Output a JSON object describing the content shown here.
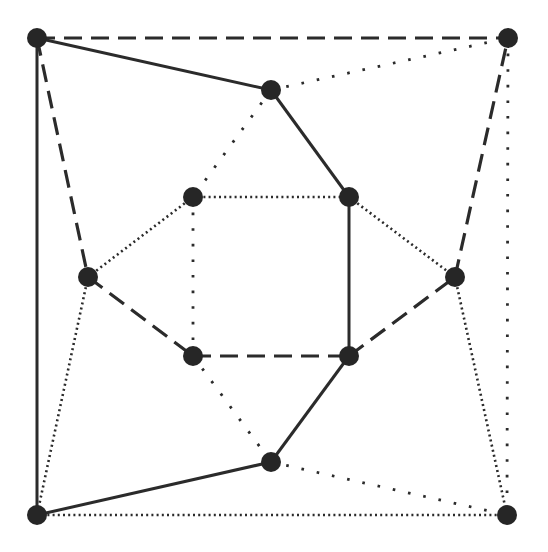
{
  "diagram": {
    "type": "graph",
    "colors": {
      "node": "#262626",
      "edge": "#2b2b2b",
      "background": "#ffffff"
    },
    "node_radius": 10,
    "nodes": [
      {
        "id": "A",
        "x": 37,
        "y": 38
      },
      {
        "id": "B",
        "x": 508,
        "y": 38
      },
      {
        "id": "C",
        "x": 271,
        "y": 90
      },
      {
        "id": "D",
        "x": 193,
        "y": 197
      },
      {
        "id": "E",
        "x": 349,
        "y": 197
      },
      {
        "id": "F",
        "x": 88,
        "y": 277
      },
      {
        "id": "G",
        "x": 455,
        "y": 277
      },
      {
        "id": "H",
        "x": 193,
        "y": 356
      },
      {
        "id": "I",
        "x": 349,
        "y": 356
      },
      {
        "id": "J",
        "x": 271,
        "y": 462
      },
      {
        "id": "K",
        "x": 37,
        "y": 515
      },
      {
        "id": "L",
        "x": 507,
        "y": 515
      }
    ],
    "edges": [
      {
        "from": "A",
        "to": "C",
        "style": "solid"
      },
      {
        "from": "C",
        "to": "E",
        "style": "solid"
      },
      {
        "from": "E",
        "to": "I",
        "style": "solid"
      },
      {
        "from": "I",
        "to": "J",
        "style": "solid"
      },
      {
        "from": "J",
        "to": "K",
        "style": "solid"
      },
      {
        "from": "A",
        "to": "K",
        "style": "solid"
      },
      {
        "from": "A",
        "to": "B",
        "style": "dashed"
      },
      {
        "from": "A",
        "to": "F",
        "style": "dashed"
      },
      {
        "from": "F",
        "to": "H",
        "style": "dashed"
      },
      {
        "from": "H",
        "to": "I",
        "style": "dashed"
      },
      {
        "from": "I",
        "to": "G",
        "style": "dashed"
      },
      {
        "from": "G",
        "to": "B",
        "style": "dashed"
      },
      {
        "from": "D",
        "to": "E",
        "style": "dotted-dense"
      },
      {
        "from": "D",
        "to": "F",
        "style": "dotted-dense"
      },
      {
        "from": "E",
        "to": "G",
        "style": "dotted-dense"
      },
      {
        "from": "F",
        "to": "K",
        "style": "dotted-dense"
      },
      {
        "from": "K",
        "to": "L",
        "style": "dotted-dense"
      },
      {
        "from": "G",
        "to": "L",
        "style": "dotted-dense"
      },
      {
        "from": "C",
        "to": "B",
        "style": "dotted-sparse"
      },
      {
        "from": "C",
        "to": "D",
        "style": "dotted-sparse"
      },
      {
        "from": "D",
        "to": "H",
        "style": "dotted-sparse"
      },
      {
        "from": "H",
        "to": "J",
        "style": "dotted-sparse"
      },
      {
        "from": "J",
        "to": "L",
        "style": "dotted-sparse"
      },
      {
        "from": "B",
        "to": "L",
        "style": "dotted-sparse"
      }
    ]
  }
}
